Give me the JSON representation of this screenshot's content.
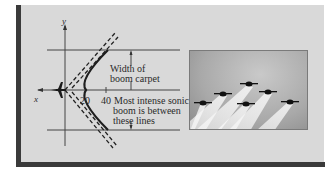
{
  "figure": {
    "axes": {
      "x_label": "x",
      "y_label": "y",
      "tick_labels": [
        "20",
        "40"
      ]
    },
    "annotations": {
      "carpet_width_line1": "Width of",
      "carpet_width_line2": "boom carpet",
      "intense_line1": "Most intense sonic",
      "intense_line2": "boom is between",
      "intense_line3": "these lines"
    },
    "icons": {
      "aircraft": "aircraft-icon"
    },
    "photo": {
      "subject": "jet formation with contrails",
      "jet_count": 6
    },
    "colors": {
      "panel_bg": "#d9d9d9",
      "frame": "#3a3a3a",
      "ink": "#2a2a2a"
    }
  }
}
